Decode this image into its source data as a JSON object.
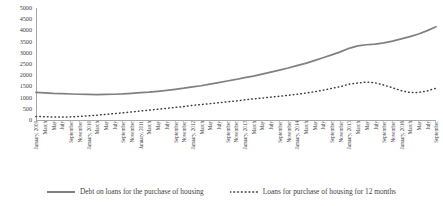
{
  "chart_data": {
    "type": "line",
    "title": "",
    "subtitle": "",
    "xlabel": "",
    "ylabel": "",
    "ylim": [
      0,
      5000
    ],
    "y_ticks": [
      0,
      500,
      1000,
      1500,
      2000,
      2500,
      3000,
      3500,
      4000,
      4500,
      5000
    ],
    "grid": false,
    "legend_position": "bottom",
    "colors": {
      "debt_line": "#808080",
      "loans_line": "#3f3f3f",
      "axis": "#a6a6a6",
      "text": "#3f3f3f",
      "background": "#ffffff"
    },
    "categories": [
      "January, 2009",
      "March",
      "May",
      "July",
      "September",
      "November",
      "January, 2010",
      "March",
      "May",
      "July",
      "September",
      "November",
      "January, 2011",
      "March",
      "May",
      "July",
      "September",
      "November",
      "January, 2012",
      "March",
      "May",
      "July",
      "September",
      "November",
      "January, 2013",
      "March",
      "May",
      "July",
      "September",
      "November",
      "January, 2014",
      "March",
      "May",
      "July",
      "September",
      "November",
      "January, 2015",
      "March",
      "May",
      "July",
      "September",
      "November",
      "January, 2016",
      "March",
      "May",
      "July",
      "September"
    ],
    "series": [
      {
        "name": "Debt on loans for the purchase of housing",
        "style": "solid",
        "color": "#808080",
        "values": [
          1230,
          1215,
          1190,
          1175,
          1160,
          1150,
          1140,
          1135,
          1140,
          1150,
          1165,
          1190,
          1220,
          1245,
          1280,
          1320,
          1370,
          1420,
          1480,
          1530,
          1600,
          1670,
          1740,
          1810,
          1890,
          1960,
          2050,
          2140,
          2230,
          2320,
          2430,
          2530,
          2650,
          2780,
          2910,
          3040,
          3200,
          3310,
          3360,
          3390,
          3440,
          3520,
          3620,
          3720,
          3840,
          3990,
          4160
        ]
      },
      {
        "name": "Loans for purchase of housing for 12 months",
        "style": "dotted",
        "color": "#3f3f3f",
        "values": [
          160,
          145,
          135,
          130,
          140,
          160,
          185,
          215,
          250,
          285,
          320,
          360,
          400,
          440,
          480,
          520,
          560,
          600,
          650,
          690,
          730,
          770,
          810,
          850,
          900,
          940,
          980,
          1020,
          1060,
          1100,
          1150,
          1200,
          1260,
          1330,
          1410,
          1490,
          1600,
          1650,
          1690,
          1660,
          1560,
          1440,
          1310,
          1230,
          1230,
          1300,
          1420
        ]
      }
    ]
  },
  "legend": {
    "items": [
      {
        "label": "Debt on loans for the purchase of housing",
        "marker": "solid-line-swatch"
      },
      {
        "label": "Loans for purchase of housing for 12 months",
        "marker": "dotted-line-swatch"
      }
    ]
  }
}
